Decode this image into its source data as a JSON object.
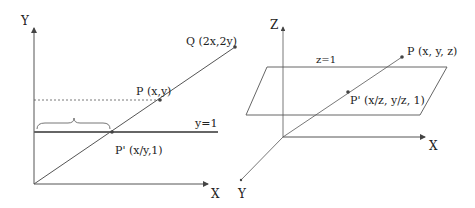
{
  "left_diagram": {
    "axis_y_label": "Y",
    "axis_x_label": "X",
    "point_q_label": "Q (2x,2y)",
    "point_p_label": "P (x,y)",
    "point_p_prime_label": "P' (x/y,1)",
    "line_label": "y=1"
  },
  "right_diagram": {
    "axis_z_label": "Z",
    "axis_x_label": "X",
    "axis_y_label": "Y",
    "plane_label": "z=1",
    "point_p_label": "P (x, y, z)",
    "point_p_prime_label": "P' (x/z, y/z, 1)"
  },
  "colors": {
    "line": "#555555",
    "thick_line": "#666666",
    "text": "#222222"
  }
}
